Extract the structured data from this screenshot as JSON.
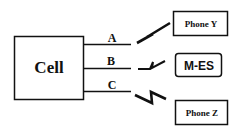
{
  "diagram": {
    "cell": {
      "label": "Cell"
    },
    "links": [
      {
        "label": "A",
        "target": "Phone Y"
      },
      {
        "label": "B",
        "target": "M-ES"
      },
      {
        "label": "C",
        "target": "Phone Z"
      }
    ],
    "nodes": {
      "phone_y": {
        "label": "Phone Y"
      },
      "mes": {
        "label": "M-ES"
      },
      "phone_z": {
        "label": "Phone Z"
      }
    },
    "colors": {
      "stroke": "#111111",
      "background": "#ffffff"
    }
  }
}
